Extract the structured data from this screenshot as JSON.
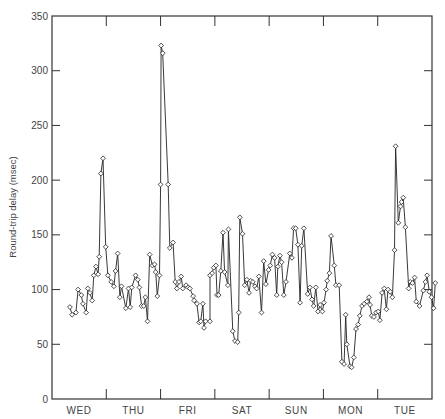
{
  "chart_data": {
    "type": "line",
    "title": "",
    "xlabel": "",
    "ylabel": "Round-trip delay (msec)",
    "ylim": [
      0,
      350
    ],
    "yticks": [
      0,
      50,
      100,
      150,
      200,
      250,
      300,
      350
    ],
    "grid": false,
    "legend": null,
    "marker": "open-diamond",
    "x_categories": [
      "WED",
      "THU",
      "FRI",
      "SAT",
      "SUN",
      "MON",
      "TUE"
    ],
    "x_range_days": [
      0,
      7
    ],
    "series": [
      {
        "name": "Round-trip delay",
        "points": [
          [
            0.33,
            84
          ],
          [
            0.37,
            77
          ],
          [
            0.44,
            79
          ],
          [
            0.48,
            100
          ],
          [
            0.54,
            95
          ],
          [
            0.57,
            87
          ],
          [
            0.63,
            79
          ],
          [
            0.66,
            101
          ],
          [
            0.7,
            97
          ],
          [
            0.74,
            90
          ],
          [
            0.77,
            113
          ],
          [
            0.81,
            121
          ],
          [
            0.85,
            114
          ],
          [
            0.87,
            130
          ],
          [
            0.9,
            206
          ],
          [
            0.94,
            220
          ],
          [
            0.99,
            139
          ],
          [
            1.03,
            113
          ],
          [
            1.09,
            107
          ],
          [
            1.14,
            103
          ],
          [
            1.17,
            117
          ],
          [
            1.21,
            133
          ],
          [
            1.25,
            93
          ],
          [
            1.28,
            103
          ],
          [
            1.36,
            83
          ],
          [
            1.41,
            101
          ],
          [
            1.44,
            84
          ],
          [
            1.47,
            102
          ],
          [
            1.54,
            113
          ],
          [
            1.58,
            109
          ],
          [
            1.61,
            102
          ],
          [
            1.65,
            85
          ],
          [
            1.69,
            85
          ],
          [
            1.72,
            93
          ],
          [
            1.76,
            71
          ],
          [
            1.8,
            132
          ],
          [
            1.85,
            122
          ],
          [
            1.89,
            123
          ],
          [
            1.91,
            116
          ],
          [
            1.94,
            94
          ],
          [
            1.98,
            113
          ],
          [
            2.0,
            196
          ],
          [
            2.01,
            323
          ],
          [
            2.04,
            316
          ],
          [
            2.14,
            196
          ],
          [
            2.17,
            138
          ],
          [
            2.23,
            143
          ],
          [
            2.27,
            107
          ],
          [
            2.3,
            101
          ],
          [
            2.34,
            107
          ],
          [
            2.38,
            112
          ],
          [
            2.41,
            101
          ],
          [
            2.47,
            104
          ],
          [
            2.51,
            102
          ],
          [
            2.54,
            101
          ],
          [
            2.6,
            94
          ],
          [
            2.62,
            90
          ],
          [
            2.67,
            87
          ],
          [
            2.71,
            70
          ],
          [
            2.74,
            71
          ],
          [
            2.78,
            87
          ],
          [
            2.8,
            65
          ],
          [
            2.83,
            71
          ],
          [
            2.91,
            71
          ],
          [
            2.91,
            113
          ],
          [
            2.95,
            115
          ],
          [
            2.98,
            120
          ],
          [
            3.02,
            122
          ],
          [
            3.04,
            95
          ],
          [
            3.07,
            95
          ],
          [
            3.11,
            117
          ],
          [
            3.15,
            152
          ],
          [
            3.18,
            116
          ],
          [
            3.24,
            104
          ],
          [
            3.25,
            155
          ],
          [
            3.33,
            62
          ],
          [
            3.37,
            53
          ],
          [
            3.42,
            52
          ],
          [
            3.44,
            79
          ],
          [
            3.46,
            166
          ],
          [
            3.51,
            151
          ],
          [
            3.55,
            104
          ],
          [
            3.59,
            109
          ],
          [
            3.63,
            97
          ],
          [
            3.66,
            108
          ],
          [
            3.7,
            107
          ],
          [
            3.74,
            103
          ],
          [
            3.77,
            101
          ],
          [
            3.81,
            112
          ],
          [
            3.86,
            79
          ],
          [
            3.9,
            126
          ],
          [
            3.94,
            105
          ],
          [
            3.99,
            118
          ],
          [
            4.02,
            122
          ],
          [
            4.06,
            132
          ],
          [
            4.1,
            129
          ],
          [
            4.14,
            95
          ],
          [
            4.16,
            121
          ],
          [
            4.2,
            131
          ],
          [
            4.23,
            125
          ],
          [
            4.27,
            95
          ],
          [
            4.31,
            107
          ],
          [
            4.38,
            133
          ],
          [
            4.42,
            129
          ],
          [
            4.45,
            156
          ],
          [
            4.49,
            156
          ],
          [
            4.53,
            141
          ],
          [
            4.57,
            88
          ],
          [
            4.6,
            140
          ],
          [
            4.64,
            156
          ],
          [
            4.71,
            96
          ],
          [
            4.75,
            102
          ],
          [
            4.79,
            91
          ],
          [
            4.82,
            85
          ],
          [
            4.86,
            102
          ],
          [
            4.9,
            80
          ],
          [
            4.94,
            86
          ],
          [
            4.98,
            80
          ],
          [
            5.01,
            88
          ],
          [
            5.05,
            100
          ],
          [
            5.07,
            108
          ],
          [
            5.11,
            115
          ],
          [
            5.14,
            149
          ],
          [
            5.2,
            122
          ],
          [
            5.23,
            104
          ],
          [
            5.29,
            104
          ],
          [
            5.34,
            34
          ],
          [
            5.38,
            32
          ],
          [
            5.41,
            77
          ],
          [
            5.43,
            50
          ],
          [
            5.49,
            30
          ],
          [
            5.52,
            29
          ],
          [
            5.56,
            38
          ],
          [
            5.6,
            64
          ],
          [
            5.64,
            68
          ],
          [
            5.67,
            76
          ],
          [
            5.71,
            85
          ],
          [
            5.75,
            87
          ],
          [
            5.8,
            89
          ],
          [
            5.84,
            93
          ],
          [
            5.86,
            86
          ],
          [
            5.89,
            76
          ],
          [
            5.93,
            75
          ],
          [
            5.97,
            79
          ],
          [
            6.01,
            80
          ],
          [
            6.04,
            72
          ],
          [
            6.08,
            97
          ],
          [
            6.12,
            101
          ],
          [
            6.16,
            82
          ],
          [
            6.19,
            100
          ],
          [
            6.23,
            98
          ],
          [
            6.27,
            93
          ],
          [
            6.31,
            136
          ],
          [
            6.33,
            231
          ],
          [
            6.38,
            161
          ],
          [
            6.42,
            176
          ],
          [
            6.44,
            180
          ],
          [
            6.47,
            184
          ],
          [
            6.51,
            157
          ],
          [
            6.57,
            101
          ],
          [
            6.6,
            107
          ],
          [
            6.64,
            106
          ],
          [
            6.68,
            111
          ],
          [
            6.71,
            89
          ],
          [
            6.77,
            85
          ],
          [
            6.84,
            99
          ],
          [
            6.88,
            107
          ],
          [
            6.91,
            113
          ],
          [
            6.95,
            98
          ],
          [
            6.99,
            93
          ],
          [
            7.03,
            83
          ],
          [
            7.06,
            106
          ]
        ]
      }
    ]
  },
  "axes": {
    "y_title": "Round-trip delay (msec)",
    "y_tick_labels": [
      "0",
      "50",
      "100",
      "150",
      "200",
      "250",
      "300",
      "350"
    ],
    "x_tick_labels": [
      "WED",
      "THU",
      "FRI",
      "SAT",
      "SUN",
      "MON",
      "TUE"
    ]
  },
  "style": {
    "line_color": "#222222",
    "axis_color": "#333333",
    "marker_fill": "#ffffff",
    "background": "#ffffff"
  }
}
